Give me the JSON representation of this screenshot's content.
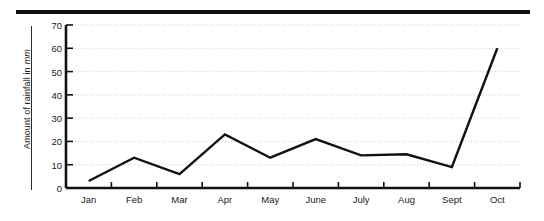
{
  "figure": {
    "top_rule": "horizontal-rule",
    "line_color": "#111111",
    "grid_color": "#cfcfcf",
    "axis_color": "#111111",
    "background": "#ffffff"
  },
  "axes": {
    "y_title_text": "Amount of rainfall in",
    "y_title_unit": "mm",
    "y_ticklabels": [
      "70",
      "60",
      "50",
      "40",
      "30",
      "20",
      "10",
      "0"
    ],
    "x_ticklabels": [
      "Jan",
      "Feb",
      "Mar",
      "Apr",
      "May",
      "June",
      "July",
      "Aug",
      "Sept",
      "Oct"
    ]
  },
  "chart_data": {
    "type": "line",
    "title": "",
    "xlabel": "",
    "ylabel": "Amount of rainfall in mm",
    "categories": [
      "Jan",
      "Feb",
      "Mar",
      "Apr",
      "May",
      "June",
      "July",
      "Aug",
      "Sept",
      "Oct"
    ],
    "values": [
      3,
      13,
      6,
      23,
      13,
      21,
      14,
      14.5,
      9,
      60
    ],
    "ylim": [
      0,
      70
    ],
    "yticks": [
      0,
      10,
      20,
      30,
      40,
      50,
      60,
      70
    ],
    "grid": "horizontal-dotted",
    "legend": "none",
    "markers": "none",
    "series": [
      {
        "name": "Rainfall",
        "values": [
          3,
          13,
          6,
          23,
          13,
          21,
          14,
          14.5,
          9,
          60
        ]
      }
    ]
  }
}
